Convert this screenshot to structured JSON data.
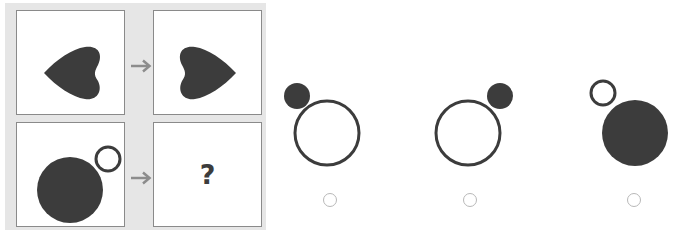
{
  "puzzle": {
    "type": "analogy",
    "rule_example": {
      "source": {
        "shape": "heart",
        "orientation": "point-left",
        "fill": "#3c3c3c"
      },
      "target": {
        "shape": "heart",
        "orientation": "point-right",
        "fill": "#3c3c3c"
      },
      "transformation": "horizontal-mirror"
    },
    "question": {
      "source": {
        "large_circle": {
          "fill": "#3c3c3c",
          "position": "bottom-left"
        },
        "small_circle": {
          "fill": "none",
          "stroke": "#3c3c3c",
          "position": "top-right"
        }
      },
      "target_label": "?"
    },
    "arrow_symbol": "arrow-right",
    "colors": {
      "panel_bg": "#e6e6e6",
      "cell_border": "#8a8a8a",
      "shape_dark": "#3c3c3c",
      "arrow": "#8c8c8c",
      "radio_border": "#b8b8b8"
    }
  },
  "options": [
    {
      "id": "A",
      "large_circle": "outline",
      "small_circle": "filled",
      "small_position": "top-left"
    },
    {
      "id": "B",
      "large_circle": "outline",
      "small_circle": "filled",
      "small_position": "top-right"
    },
    {
      "id": "C",
      "large_circle": "filled",
      "small_circle": "outline",
      "small_position": "top-left"
    }
  ]
}
